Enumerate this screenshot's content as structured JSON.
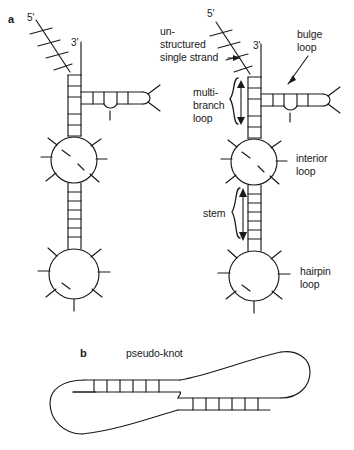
{
  "figure": {
    "background_color": "#ffffff",
    "stroke_color": "#1a1a1a"
  },
  "panels": [
    {
      "letter": "a",
      "description": "Two RNA secondary structures with labelled structural motifs"
    },
    {
      "letter": "b",
      "title": "pseudo-knot",
      "description": "Pseudo-knot topology with two crossing duplex regions"
    }
  ],
  "panel_a": {
    "letter": "a",
    "left_structure": {
      "five_prime": "5'",
      "three_prime": "3'"
    },
    "right_structure": {
      "five_prime": "5'",
      "three_prime": "3'"
    },
    "annotations": [
      {
        "id": "unstructured-single-strand",
        "lines": [
          "un-",
          "structured",
          "single strand"
        ]
      },
      {
        "id": "bulge-loop",
        "lines": [
          "bulge",
          "loop"
        ]
      },
      {
        "id": "multi-branch-loop",
        "lines": [
          "multi-",
          "branch",
          "loop"
        ]
      },
      {
        "id": "interior-loop",
        "lines": [
          "interior",
          "loop"
        ]
      },
      {
        "id": "stem",
        "lines": [
          "stem"
        ]
      },
      {
        "id": "hairpin-loop",
        "lines": [
          "hairpin",
          "loop"
        ]
      }
    ]
  },
  "panel_b": {
    "letter": "b",
    "title": "pseudo-knot"
  },
  "labels": {
    "panel_a_letter": "a",
    "panel_b_letter": "b",
    "left_five_prime": "5'",
    "left_three_prime": "3'",
    "right_five_prime": "5'",
    "right_three_prime": "3'",
    "unstructured_line1": "un-",
    "unstructured_line2": "structured",
    "unstructured_line3": "single strand",
    "bulge_line1": "bulge",
    "bulge_line2": "loop",
    "multibranch_line1": "multi-",
    "multibranch_line2": "branch",
    "multibranch_line3": "loop",
    "interior_line1": "interior",
    "interior_line2": "loop",
    "stem_label": "stem",
    "hairpin_line1": "hairpin",
    "hairpin_line2": "loop",
    "pseudoknot_title": "pseudo-knot"
  }
}
